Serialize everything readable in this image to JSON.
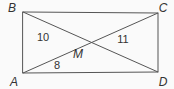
{
  "figure": {
    "type": "geometry-diagram",
    "labels": {
      "top_left": "B",
      "top_right": "C",
      "bottom_left": "A",
      "bottom_right": "D",
      "intersection": "M"
    },
    "measurements": {
      "segment_BM": "10",
      "segment_MC": "11",
      "segment_AM": "8"
    },
    "colors": {
      "line": "#555555",
      "text": "#333333",
      "background": "#fafafa"
    }
  }
}
